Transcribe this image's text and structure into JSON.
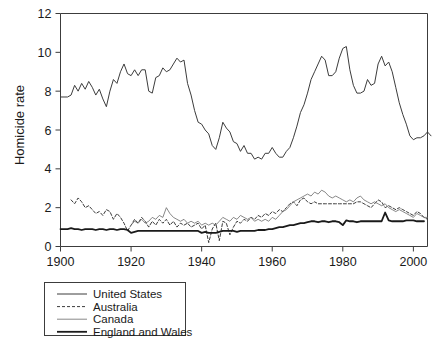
{
  "chart_data": {
    "type": "line",
    "title": "",
    "xlabel": "",
    "ylabel": "Homicide rate",
    "xlim": [
      1900,
      2004
    ],
    "ylim": [
      0,
      12
    ],
    "grid": false,
    "legend_position": "below-left",
    "xticks": [
      1900,
      1920,
      1940,
      1960,
      1980,
      2000
    ],
    "yticks": [
      0,
      2,
      4,
      6,
      8,
      10,
      12
    ],
    "xtick_labels": [
      "1900",
      "1920",
      "1940",
      "1960",
      "1980",
      "2000"
    ],
    "ytick_labels": [
      "0",
      "2",
      "4",
      "6",
      "8",
      "10",
      "12"
    ],
    "series": [
      {
        "name": "United States",
        "style": "solid",
        "color": "#3c3c3c",
        "width": 1.0,
        "x_start": 1900,
        "values": [
          7.7,
          7.7,
          7.7,
          7.8,
          8.3,
          8.0,
          8.4,
          8.1,
          8.5,
          8.2,
          7.8,
          8.1,
          7.6,
          7.2,
          8.0,
          8.6,
          8.4,
          9.0,
          9.4,
          8.9,
          8.8,
          9.1,
          8.8,
          9.1,
          9.1,
          8.0,
          7.9,
          8.7,
          8.8,
          9.2,
          9.0,
          9.1,
          9.4,
          9.7,
          9.5,
          9.6,
          8.4,
          7.8,
          7.0,
          6.4,
          6.3,
          6.0,
          5.8,
          5.2,
          5.0,
          5.6,
          6.4,
          6.1,
          5.9,
          5.4,
          5.3,
          4.9,
          5.2,
          4.8,
          4.8,
          4.5,
          4.6,
          4.5,
          4.8,
          4.8,
          5.1,
          4.8,
          4.6,
          4.6,
          4.9,
          5.1,
          5.6,
          6.2,
          6.9,
          7.3,
          7.9,
          8.6,
          9.0,
          9.4,
          9.8,
          9.6,
          8.8,
          8.8,
          9.0,
          9.7,
          10.2,
          10.3,
          9.1,
          8.3,
          7.9,
          7.9,
          8.0,
          8.6,
          8.3,
          8.4,
          9.4,
          9.8,
          9.3,
          9.5,
          9.0,
          8.2,
          7.4,
          6.8,
          6.3,
          5.7,
          5.5,
          5.6,
          5.6,
          5.7,
          5.9,
          5.7
        ]
      },
      {
        "name": "Australia",
        "style": "dashed",
        "color": "#3c3c3c",
        "width": 1.0,
        "x_start": 1903,
        "values": [
          2.4,
          2.2,
          2.5,
          2.3,
          2.0,
          2.1,
          1.9,
          1.7,
          1.8,
          1.6,
          1.9,
          1.8,
          1.4,
          1.7,
          1.5,
          1.2,
          0.8,
          1.1,
          1.4,
          1.2,
          1.5,
          1.3,
          1.0,
          1.3,
          1.1,
          1.4,
          1.2,
          1.4,
          1.1,
          1.3,
          1.0,
          1.2,
          1.1,
          1.2,
          1.0,
          1.1,
          1.2,
          0.9,
          1.1,
          0.2,
          0.9,
          1.2,
          0.3,
          1.3,
          1.2,
          0.6,
          1.0,
          1.3,
          1.2,
          1.4,
          1.3,
          1.5,
          1.4,
          1.6,
          1.5,
          1.7,
          1.6,
          1.8,
          1.7,
          1.9,
          1.8,
          2.0,
          2.2,
          2.3,
          2.1,
          2.4,
          2.5,
          2.3,
          2.2,
          2.3,
          2.2,
          2.2,
          2.2,
          2.2,
          2.2,
          2.2,
          2.2,
          2.2,
          2.2,
          2.2,
          2.2,
          2.3,
          2.3,
          2.2,
          2.1,
          2.0,
          2.2,
          2.4,
          2.3,
          2.0,
          2.1,
          2.0,
          1.9,
          2.0,
          1.9,
          1.8,
          1.7,
          1.6,
          1.8,
          1.7,
          1.5,
          1.4
        ]
      },
      {
        "name": "Canada",
        "style": "solid-thin",
        "color": "#6a6a6a",
        "width": 0.8,
        "x_start": 1920,
        "values": [
          1.1,
          1.3,
          1.2,
          1.4,
          1.2,
          1.3,
          1.5,
          1.4,
          1.6,
          1.5,
          2.0,
          1.7,
          1.5,
          1.4,
          1.3,
          1.4,
          1.2,
          1.3,
          1.2,
          1.3,
          1.1,
          1.2,
          1.1,
          1.2,
          1.1,
          1.3,
          1.5,
          1.4,
          1.3,
          1.5,
          1.4,
          1.6,
          1.5,
          1.4,
          1.5,
          1.3,
          1.4,
          1.3,
          1.4,
          1.3,
          1.5,
          1.4,
          1.6,
          1.8,
          1.9,
          2.1,
          2.3,
          2.4,
          2.5,
          2.6,
          2.7,
          2.6,
          2.8,
          2.7,
          2.9,
          2.8,
          2.6,
          2.5,
          2.6,
          2.5,
          2.4,
          2.3,
          2.4,
          2.3,
          2.5,
          2.6,
          2.4,
          2.3,
          2.2,
          2.3,
          2.2,
          2.1,
          2.2,
          2.0,
          1.9,
          1.8,
          1.9,
          1.8,
          1.7,
          1.6,
          1.5,
          1.7,
          1.6,
          1.5,
          1.5
        ]
      },
      {
        "name": "England and Wales",
        "style": "solid-thick",
        "color": "#1a1a1a",
        "width": 1.8,
        "x_start": 1900,
        "values": [
          0.9,
          0.9,
          0.9,
          0.95,
          0.9,
          0.9,
          0.85,
          0.9,
          0.9,
          0.9,
          0.85,
          0.9,
          0.9,
          0.85,
          0.9,
          0.9,
          0.85,
          0.9,
          0.9,
          0.85,
          0.7,
          0.75,
          0.8,
          0.8,
          0.8,
          0.8,
          0.8,
          0.8,
          0.8,
          0.8,
          0.8,
          0.8,
          0.8,
          0.8,
          0.8,
          0.8,
          0.8,
          0.8,
          0.8,
          0.8,
          0.7,
          0.75,
          0.7,
          0.7,
          0.7,
          0.75,
          0.8,
          0.8,
          0.8,
          0.8,
          0.75,
          0.8,
          0.8,
          0.8,
          0.8,
          0.8,
          0.85,
          0.85,
          0.85,
          0.9,
          0.9,
          0.95,
          1.0,
          1.0,
          1.05,
          1.1,
          1.1,
          1.15,
          1.2,
          1.2,
          1.25,
          1.3,
          1.3,
          1.25,
          1.3,
          1.3,
          1.25,
          1.3,
          1.3,
          1.25,
          1.1,
          1.35,
          1.3,
          1.3,
          1.25,
          1.3,
          1.3,
          1.3,
          1.3,
          1.3,
          1.3,
          1.3,
          1.75,
          1.35,
          1.3,
          1.3,
          1.3,
          1.3,
          1.35,
          1.35,
          1.35,
          1.3,
          1.3,
          1.3
        ]
      }
    ]
  },
  "legend": {
    "items": [
      {
        "label": "United States",
        "style": "solid"
      },
      {
        "label": "Australia",
        "style": "dashed"
      },
      {
        "label": "Canada",
        "style": "solid-thin"
      },
      {
        "label": "England and Wales",
        "style": "solid-thick"
      }
    ]
  }
}
